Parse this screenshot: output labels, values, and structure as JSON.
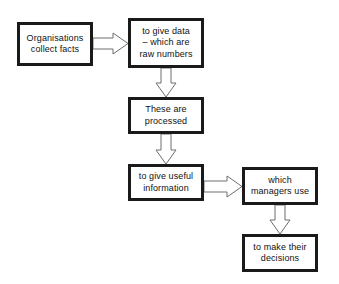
{
  "diagram": {
    "type": "flowchart",
    "background_color": "#ffffff",
    "box_border_color": "#1a1a1a",
    "box_fill_color": "#ffffff",
    "arrow_stroke_color": "#6e6e6e",
    "arrow_fill_color": "#ffffff",
    "text_color": "#111111",
    "nodes": [
      {
        "id": "collect-facts",
        "label": "Organisations\ncollect facts",
        "line1": "Organisations",
        "line2": "collect facts"
      },
      {
        "id": "raw-data",
        "label": "to give data\n– which are\nraw numbers",
        "line1": "to give data",
        "line2": "– which are",
        "line3": "raw numbers"
      },
      {
        "id": "processed",
        "label": "These are\nprocessed",
        "line1": "These are",
        "line2": "processed"
      },
      {
        "id": "useful-info",
        "label": "to give useful\ninformation",
        "line1": "to give useful",
        "line2": "information"
      },
      {
        "id": "managers-use",
        "label": "which\nmanagers use",
        "line1": "which",
        "line2": "managers use"
      },
      {
        "id": "decisions",
        "label": "to make their\ndecisions",
        "line1": "to make their",
        "line2": "decisions"
      }
    ],
    "edges": [
      {
        "id": "edge-1",
        "from": "collect-facts",
        "to": "raw-data",
        "direction": "right",
        "style": "block-arrow"
      },
      {
        "id": "edge-2",
        "from": "raw-data",
        "to": "processed",
        "direction": "down",
        "style": "block-arrow"
      },
      {
        "id": "edge-3",
        "from": "processed",
        "to": "useful-info",
        "direction": "down",
        "style": "block-arrow"
      },
      {
        "id": "edge-4",
        "from": "useful-info",
        "to": "managers-use",
        "direction": "right",
        "style": "block-arrow"
      },
      {
        "id": "edge-5",
        "from": "managers-use",
        "to": "decisions",
        "direction": "down",
        "style": "block-arrow"
      }
    ]
  }
}
